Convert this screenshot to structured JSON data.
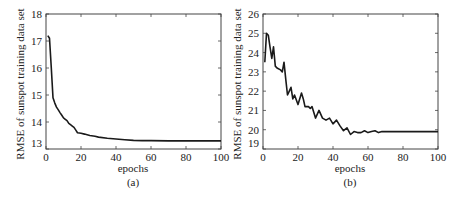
{
  "chart_data": [
    {
      "type": "line",
      "panel_label": "(a)",
      "xlabel": "epochs",
      "ylabel": "RMSE of sunspot training data set",
      "xlim": [
        0,
        100
      ],
      "ylim": [
        13,
        18
      ],
      "xticks": [
        0,
        20,
        40,
        60,
        80,
        100
      ],
      "yticks": [
        13,
        14,
        15,
        16,
        17,
        18
      ],
      "grid": false,
      "series": [
        {
          "name": "RMSE",
          "x": [
            1,
            2,
            3,
            4,
            5,
            6,
            7,
            8,
            9,
            10,
            11,
            12,
            13,
            14,
            15,
            16,
            17,
            18,
            20,
            22,
            25,
            28,
            30,
            35,
            40,
            45,
            50,
            55,
            60,
            70,
            80,
            90,
            100
          ],
          "y": [
            17.2,
            17.1,
            16.0,
            14.9,
            14.7,
            14.55,
            14.45,
            14.35,
            14.25,
            14.15,
            14.1,
            14.05,
            13.95,
            13.9,
            13.85,
            13.8,
            13.7,
            13.6,
            13.58,
            13.55,
            13.5,
            13.47,
            13.44,
            13.4,
            13.37,
            13.34,
            13.32,
            13.31,
            13.31,
            13.3,
            13.3,
            13.3,
            13.3
          ]
        }
      ]
    },
    {
      "type": "line",
      "panel_label": "(b)",
      "xlabel": "epochs",
      "ylabel": "RMSE of sunspot training data set",
      "xlim": [
        0,
        100
      ],
      "ylim": [
        19,
        26
      ],
      "xticks": [
        0,
        20,
        40,
        60,
        80,
        100
      ],
      "yticks": [
        19,
        20,
        21,
        22,
        23,
        24,
        25,
        26
      ],
      "grid": false,
      "series": [
        {
          "name": "RMSE",
          "x": [
            1,
            2,
            3,
            4,
            5,
            6,
            7,
            8,
            10,
            11,
            12,
            13,
            14,
            15,
            16,
            17,
            18,
            20,
            22,
            23,
            24,
            26,
            27,
            28,
            30,
            32,
            34,
            36,
            38,
            40,
            42,
            44,
            46,
            48,
            50,
            52,
            54,
            56,
            58,
            60,
            62,
            64,
            66,
            68,
            70,
            75,
            80,
            85,
            90,
            95,
            100
          ],
          "y": [
            23.5,
            25.0,
            24.9,
            24.3,
            23.7,
            24.3,
            23.3,
            23.2,
            23.1,
            23.0,
            23.5,
            22.6,
            21.8,
            22.0,
            22.2,
            21.6,
            21.8,
            21.3,
            21.9,
            21.6,
            21.2,
            21.2,
            21.1,
            21.2,
            20.6,
            21.0,
            20.6,
            20.5,
            20.6,
            20.3,
            20.5,
            20.2,
            19.95,
            20.1,
            19.75,
            19.9,
            19.85,
            19.85,
            19.95,
            19.85,
            19.9,
            19.95,
            19.85,
            19.9,
            19.9,
            19.9,
            19.9,
            19.9,
            19.9,
            19.9,
            19.9
          ]
        }
      ]
    }
  ],
  "panels": [
    {
      "id": "a",
      "label": "(a)",
      "xlabel": "epochs",
      "ylabel": "RMSE of sunspot training data set",
      "xticks": [
        "0",
        "20",
        "40",
        "60",
        "80",
        "100"
      ],
      "yticks": [
        "13",
        "14",
        "15",
        "16",
        "17",
        "18"
      ]
    },
    {
      "id": "b",
      "label": "(b)",
      "xlabel": "epochs",
      "ylabel": "RMSE of sunspot training data set",
      "xticks": [
        "0",
        "20",
        "40",
        "60",
        "80",
        "100"
      ],
      "yticks": [
        "19",
        "20",
        "21",
        "22",
        "23",
        "24",
        "25",
        "26"
      ]
    }
  ],
  "colors": {
    "line": "#1a1a1a",
    "axis": "#444444",
    "text": "#222222"
  }
}
